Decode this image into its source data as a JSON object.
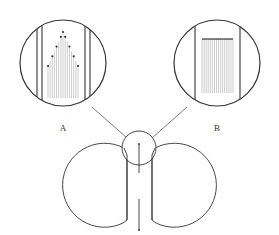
{
  "diagram": {
    "labels": {
      "a": "A",
      "b": "B"
    },
    "colors": {
      "stroke": "#333333",
      "fine_lines": "#888888",
      "background": "#ffffff"
    },
    "panels": [
      {
        "id": "A",
        "description": "magnified view with triangular arrangement of dots atop vertical lines"
      },
      {
        "id": "B",
        "description": "magnified view with dots aligned in a straight horizontal row atop vertical lines"
      }
    ]
  }
}
